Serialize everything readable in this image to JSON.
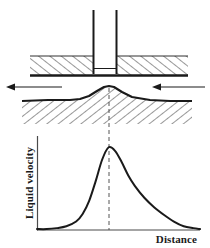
{
  "figure": {
    "title": "",
    "caption": "",
    "type": "schematic-with-plot"
  },
  "schematic": {
    "tool": {
      "name": "tool-nozzle",
      "label": "",
      "left_wall_x": 93,
      "right_wall_x": 117,
      "top_y": 10,
      "bottom_y": 73
    },
    "upper_plate": {
      "name": "upper-workpiece",
      "label": "",
      "hatch_direction": "up-right",
      "top_y": 56,
      "bottom_y": 76,
      "left_x": 30,
      "right_x": 188
    },
    "lower_plate": {
      "name": "lower-workpiece",
      "label": "",
      "hatch_direction": "down-right",
      "surface_y": 100,
      "bump_peak_y": 86,
      "bump_center_x": 109,
      "left_x": 22,
      "right_x": 192
    },
    "arrows": [
      {
        "name": "force-arrow-left",
        "label": "",
        "direction": "left",
        "x_start": 62,
        "x_end": 8,
        "y": 87
      },
      {
        "name": "force-arrow-right",
        "label": "",
        "direction": "left",
        "x_start": 205,
        "x_end": 152,
        "y": 87
      }
    ],
    "centerline": {
      "name": "center-dashed-line",
      "label": "",
      "x": 109,
      "y_top": 88,
      "y_bottom": 230
    }
  },
  "chart_data": {
    "type": "line",
    "title": "",
    "xlabel": "Distance",
    "ylabel": "Liquid velocity",
    "grid": false,
    "legend": null,
    "xlim": [
      0,
      100
    ],
    "ylim": [
      0,
      100
    ],
    "xticks": [],
    "yticks": [],
    "axis_origin_px": {
      "x": 37,
      "y": 230
    },
    "axis_x_end_px": 200,
    "axis_y_top_px": 136,
    "peak": {
      "x": 44,
      "y": 88
    },
    "series": [
      {
        "name": "liquid-velocity-profile",
        "x": [
          0,
          6,
          12,
          18,
          24,
          28,
          32,
          36,
          40,
          44,
          48,
          52,
          56,
          60,
          66,
          72,
          78,
          84,
          90,
          96,
          100
        ],
        "y": [
          1,
          1,
          2,
          4,
          9,
          17,
          31,
          52,
          75,
          88,
          84,
          72,
          58,
          47,
          34,
          24,
          16,
          9,
          4,
          2,
          1
        ]
      }
    ],
    "annotations": [
      {
        "name": "peak-centerline",
        "type": "vline",
        "x": 44,
        "style": "dashed"
      }
    ]
  }
}
